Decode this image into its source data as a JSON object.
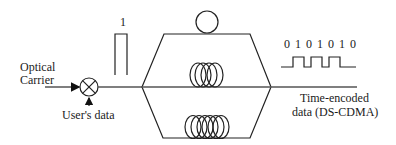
{
  "diagram": {
    "type": "optical DS-CDMA time-encoding schematic",
    "labels": {
      "input_line1": "Optical",
      "input_line2": "Carrier",
      "modulator_input": "User's data",
      "pulse_label": "1",
      "output_line1": "Time-encoded",
      "output_line2": "data (DS-CDMA)"
    },
    "code_sequence": {
      "bits": [
        "0",
        "1",
        "0",
        "1",
        "0",
        "1",
        "0"
      ],
      "text": "0 1 0 1 0 1 0"
    },
    "components": [
      {
        "id": "modulator",
        "symbol": "circle-x-multiplier"
      },
      {
        "id": "input-pulse",
        "symbol": "rectangular-pulse"
      },
      {
        "id": "splitter-combiner",
        "symbol": "hexagon-paths"
      },
      {
        "id": "delay-top",
        "symbol": "small-circle"
      },
      {
        "id": "delay-middle",
        "symbol": "fiber-coil",
        "loops": 4
      },
      {
        "id": "delay-bottom",
        "symbol": "fiber-coil",
        "loops": 6
      },
      {
        "id": "output-waveform",
        "symbol": "square-wave"
      }
    ],
    "colors": {
      "line": "#222222",
      "text": "#1a1a1a",
      "background": "#ffffff"
    }
  }
}
